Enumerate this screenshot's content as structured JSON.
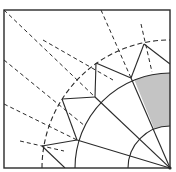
{
  "diagram": {
    "type": "origami crease pattern",
    "colors": {
      "background": "#ffffff",
      "stroke": "#2a2a2a",
      "shaded_region": "#c4c4c4"
    },
    "frame": {
      "x": 4,
      "y": 10,
      "width": 166,
      "height": 158
    },
    "center": {
      "x": 170,
      "y": 168
    },
    "arcs": [
      {
        "name": "inner-arc",
        "radius": 42,
        "style": "solid"
      },
      {
        "name": "middle-arc",
        "radius": 95,
        "style": "solid"
      },
      {
        "name": "outer-arc",
        "radius": 128,
        "style": "dashed"
      }
    ],
    "shaded_region": {
      "inner_radius": 42,
      "outer_radius": 95,
      "from_angle_deg": 68,
      "to_angle_deg": 90
    },
    "solid_lines": [
      {
        "x1": 170,
        "y1": 168,
        "x2": 131,
        "y2": 78
      },
      {
        "x1": 170,
        "y1": 168,
        "x2": 95,
        "y2": 97
      },
      {
        "x1": 170,
        "y1": 168,
        "x2": 77,
        "y2": 140
      },
      {
        "x1": 131,
        "y1": 78,
        "x2": 144,
        "y2": 44
      },
      {
        "x1": 144,
        "y1": 44,
        "x2": 170,
        "y2": 64
      },
      {
        "x1": 131,
        "y1": 78,
        "x2": 96,
        "y2": 63
      },
      {
        "x1": 96,
        "y1": 63,
        "x2": 95,
        "y2": 97
      },
      {
        "x1": 95,
        "y1": 97,
        "x2": 62,
        "y2": 99
      },
      {
        "x1": 62,
        "y1": 99,
        "x2": 77,
        "y2": 140
      },
      {
        "x1": 77,
        "y1": 140,
        "x2": 42,
        "y2": 146
      },
      {
        "x1": 42,
        "y1": 146,
        "x2": 65,
        "y2": 168
      }
    ],
    "dashed_lines": [
      {
        "x1": 4,
        "y1": 10,
        "x2": 95,
        "y2": 97
      },
      {
        "x1": 101,
        "y1": 10,
        "x2": 131,
        "y2": 78
      },
      {
        "x1": 141,
        "y1": 24,
        "x2": 152,
        "y2": 72
      },
      {
        "x1": 43,
        "y1": 40,
        "x2": 113,
        "y2": 80
      },
      {
        "x1": 4,
        "y1": 60,
        "x2": 85,
        "y2": 126
      },
      {
        "x1": 4,
        "y1": 104,
        "x2": 77,
        "y2": 140
      },
      {
        "x1": 20,
        "y1": 141,
        "x2": 64,
        "y2": 151
      }
    ]
  }
}
